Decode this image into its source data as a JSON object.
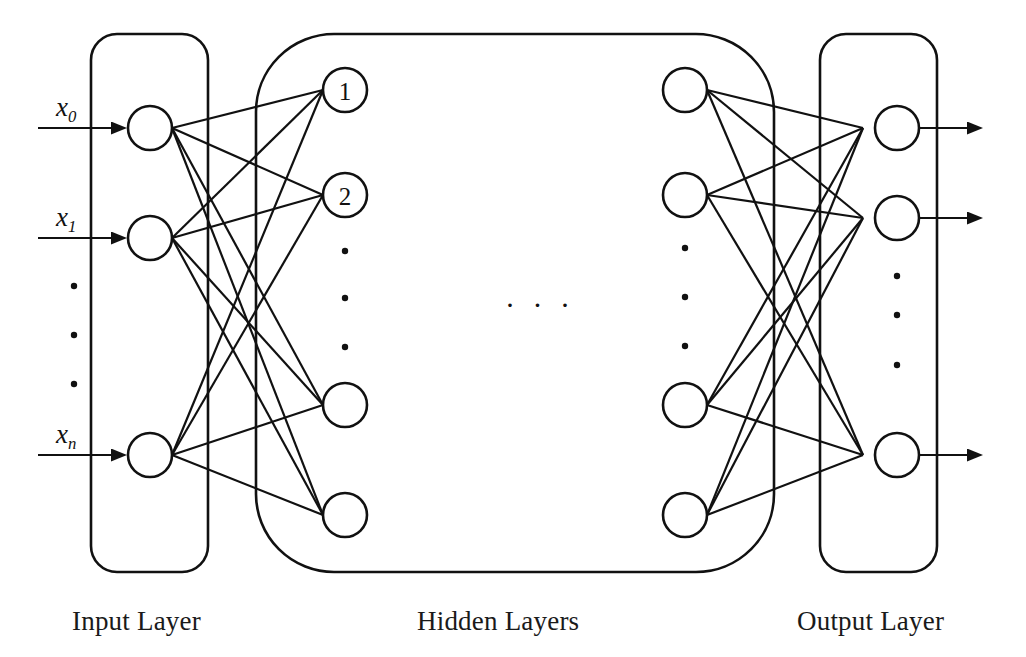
{
  "diagram": {
    "stroke_color": "#111111",
    "background_color": "#ffffff",
    "captions": {
      "input": "Input Layer",
      "hidden": "Hidden Layers",
      "output": "Output Layer"
    },
    "input_labels": [
      {
        "base": "x",
        "sub": "0"
      },
      {
        "base": "x",
        "sub": "1"
      },
      {
        "base": "x",
        "sub": "n"
      }
    ],
    "hidden_node_labels": [
      "1",
      "2"
    ],
    "ellipsis_horizontal": "· · ·",
    "layers": [
      {
        "name": "input",
        "node_count_shown": 3,
        "vertical_ellipsis_count": 3
      },
      {
        "name": "hidden",
        "columns_shown": 2,
        "nodes_per_column_shown": 4,
        "vertical_ellipsis_count": 3,
        "horizontal_ellipsis_count": 3
      },
      {
        "name": "output",
        "node_count_shown": 3,
        "vertical_ellipsis_count": 3
      }
    ]
  }
}
